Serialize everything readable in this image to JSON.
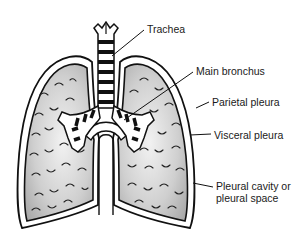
{
  "figure": {
    "labels": [
      {
        "id": "trachea",
        "text": "Trachea"
      },
      {
        "id": "main-bronchus",
        "text": "Main bronchus"
      },
      {
        "id": "parietal-pleura",
        "text": "Parietal pleura"
      },
      {
        "id": "visceral-pleura",
        "text": "Visceral pleura"
      },
      {
        "id": "pleural-cavity",
        "text": "Pleural cavity or\npleural space"
      }
    ],
    "colors": {
      "line": "#111111",
      "lung_fill": "#c8c8c8",
      "background": "#ffffff"
    }
  }
}
